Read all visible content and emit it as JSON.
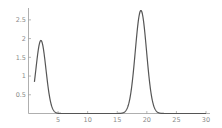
{
  "chart_data": {
    "type": "line",
    "title": "",
    "xlabel": "",
    "ylabel": "",
    "xlim": [
      0,
      30
    ],
    "ylim": [
      0,
      2.8
    ],
    "grid": false,
    "legend": null,
    "x_ticks": [
      5,
      10,
      15,
      20,
      25,
      30
    ],
    "x_tick_labels": [
      "5",
      "10",
      "15",
      "20",
      "25",
      "30"
    ],
    "y_ticks": [
      0.5,
      1,
      1.5,
      2,
      2.5
    ],
    "y_tick_labels": [
      "0.5",
      "1",
      "1.5",
      "2",
      "2.5"
    ],
    "series": [
      {
        "name": "curve",
        "color": "#555555",
        "x": [
          1,
          1.5,
          2,
          2.5,
          3,
          3.5,
          4,
          4.5,
          5,
          6,
          8,
          10,
          12,
          14,
          15,
          16,
          16.5,
          17,
          17.5,
          18,
          18.5,
          19,
          19.5,
          20,
          20.5,
          21,
          21.5,
          22,
          23,
          25,
          28,
          30
        ],
        "y": [
          1.2,
          1.75,
          1.95,
          1.75,
          1.25,
          0.7,
          0.3,
          0.1,
          0.03,
          0.0,
          0.0,
          0.0,
          0.0,
          0.0,
          0.0,
          0.03,
          0.12,
          0.4,
          0.95,
          1.7,
          2.45,
          2.75,
          2.5,
          1.85,
          1.1,
          0.5,
          0.18,
          0.05,
          0.0,
          0.0,
          0.0,
          0.0
        ]
      }
    ],
    "annotations": []
  }
}
